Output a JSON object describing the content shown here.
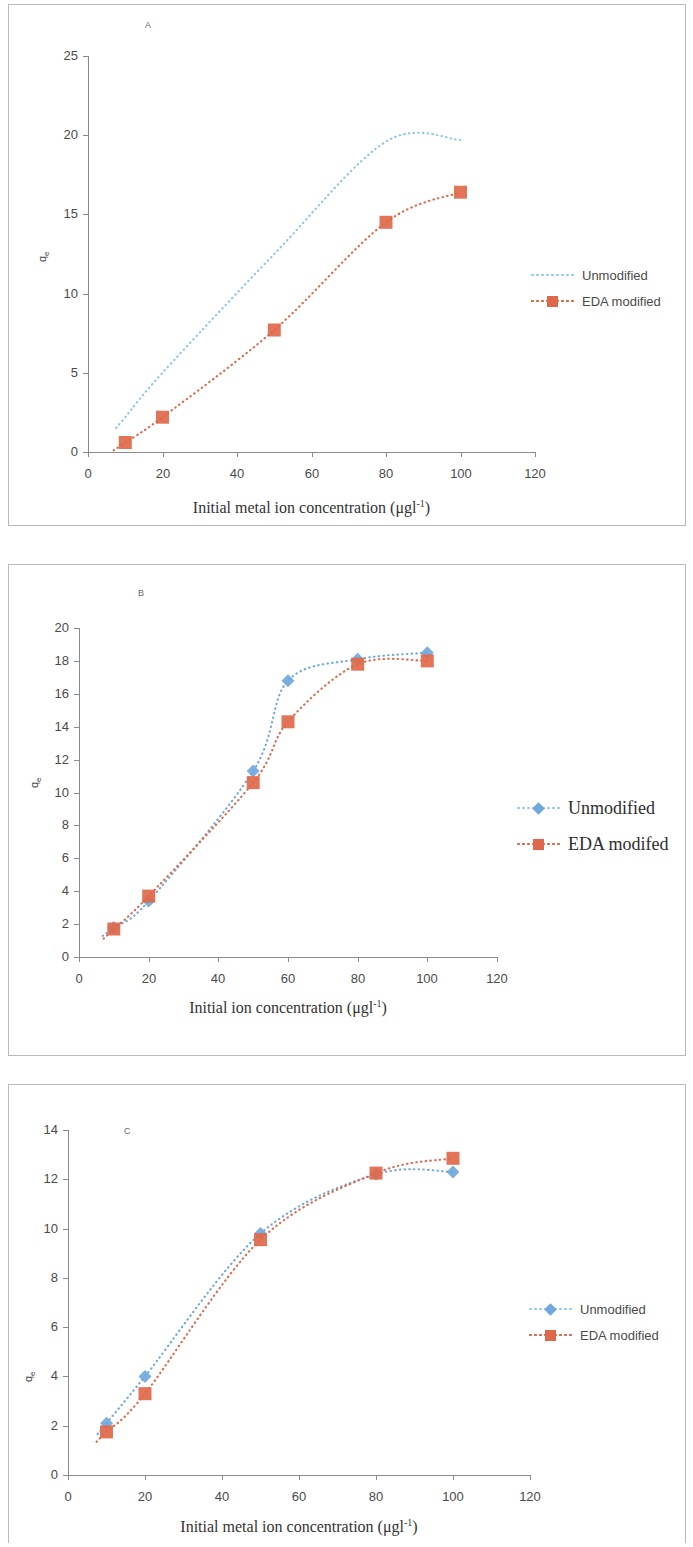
{
  "figure": {
    "panels": [
      "A",
      "B",
      "C"
    ],
    "colors": {
      "unmodified": "#8ec5e6",
      "eda": "#e0684a",
      "axis": "#8a8a8a",
      "text": "#4a4a4a"
    }
  },
  "panel_a": {
    "tag": "A",
    "xlabel_main": "Initial metal ion concentration (μgl",
    "xlabel_sup": "-1",
    "xlabel_close": ")",
    "ylabel": "q",
    "ylabel_sub": "e",
    "legend": [
      {
        "label": "Unmodified",
        "marker": "none",
        "color": "#8ec5e6"
      },
      {
        "label": "EDA modified",
        "marker": "square",
        "color": "#e0684a"
      }
    ]
  },
  "panel_b": {
    "tag": "B",
    "xlabel_main": "Initial ion  concentration (μgl",
    "xlabel_sup": "-1",
    "xlabel_close": ")",
    "ylabel": "q",
    "ylabel_sub": "e",
    "legend": [
      {
        "label": "Unmodified",
        "marker": "diamond",
        "color": "#6fa8dc"
      },
      {
        "label": "EDA modifed",
        "marker": "square",
        "color": "#e0684a"
      }
    ]
  },
  "panel_c": {
    "tag": "C",
    "xlabel_main": "Initial metal ion concentration (μgl",
    "xlabel_sup": "-1",
    "xlabel_close": ")",
    "ylabel": "q",
    "ylabel_sub": "e",
    "legend": [
      {
        "label": "Unmodified",
        "marker": "diamond",
        "color": "#6fa8dc"
      },
      {
        "label": "EDA modified",
        "marker": "square",
        "color": "#e0684a"
      }
    ]
  },
  "chart_data": [
    {
      "type": "line",
      "panel": "A",
      "title": "A",
      "xlabel": "Initial metal ion concentration (μgl-1)",
      "ylabel": "qe",
      "xlim": [
        0,
        120
      ],
      "ylim": [
        0,
        25
      ],
      "xticks": [
        0,
        20,
        40,
        60,
        80,
        100,
        120
      ],
      "yticks": [
        0,
        5,
        10,
        15,
        20,
        25
      ],
      "grid": false,
      "legend_position": "right",
      "x": [
        10,
        20,
        50,
        80,
        100
      ],
      "series": [
        {
          "name": "Unmodified",
          "values": [
            2.2,
            5.0,
            12.5,
            19.6,
            19.7
          ],
          "color": "#8ec5e6",
          "marker": "none",
          "linestyle": "dotted"
        },
        {
          "name": "EDA modified",
          "values": [
            0.6,
            2.2,
            7.7,
            14.5,
            16.4
          ],
          "color": "#e0684a",
          "marker": "square",
          "linestyle": "dotted"
        }
      ]
    },
    {
      "type": "line",
      "panel": "B",
      "title": "B",
      "xlabel": "Initial ion concentration (μgl-1)",
      "ylabel": "qe",
      "xlim": [
        0,
        120
      ],
      "ylim": [
        0,
        20
      ],
      "xticks": [
        0,
        20,
        40,
        60,
        80,
        100,
        120
      ],
      "yticks": [
        0,
        2,
        4,
        6,
        8,
        10,
        12,
        14,
        16,
        18,
        20
      ],
      "grid": false,
      "legend_position": "right",
      "x": [
        10,
        20,
        50,
        60,
        80,
        100
      ],
      "series": [
        {
          "name": "Unmodified",
          "values": [
            1.8,
            3.4,
            11.3,
            16.8,
            18.1,
            18.5
          ],
          "color": "#6fa8dc",
          "marker": "diamond",
          "linestyle": "dotted"
        },
        {
          "name": "EDA modifed",
          "values": [
            1.7,
            3.7,
            10.6,
            14.3,
            17.8,
            18.0
          ],
          "color": "#e0684a",
          "marker": "square",
          "linestyle": "dotted"
        }
      ]
    },
    {
      "type": "line",
      "panel": "C",
      "title": "C",
      "xlabel": "Initial metal ion concentration (μgl-1)",
      "ylabel": "qe",
      "xlim": [
        0,
        120
      ],
      "ylim": [
        0,
        14
      ],
      "xticks": [
        0,
        20,
        40,
        60,
        80,
        100,
        120
      ],
      "yticks": [
        0,
        2,
        4,
        6,
        8,
        10,
        12,
        14
      ],
      "grid": false,
      "legend_position": "right",
      "x": [
        10,
        20,
        50,
        80,
        100
      ],
      "series": [
        {
          "name": "Unmodified",
          "values": [
            2.1,
            4.0,
            9.8,
            12.2,
            12.3
          ],
          "color": "#6fa8dc",
          "marker": "diamond",
          "linestyle": "dotted"
        },
        {
          "name": "EDA modified",
          "values": [
            1.75,
            3.3,
            9.55,
            12.25,
            12.85
          ],
          "color": "#e0684a",
          "marker": "square",
          "linestyle": "dotted"
        }
      ]
    }
  ]
}
